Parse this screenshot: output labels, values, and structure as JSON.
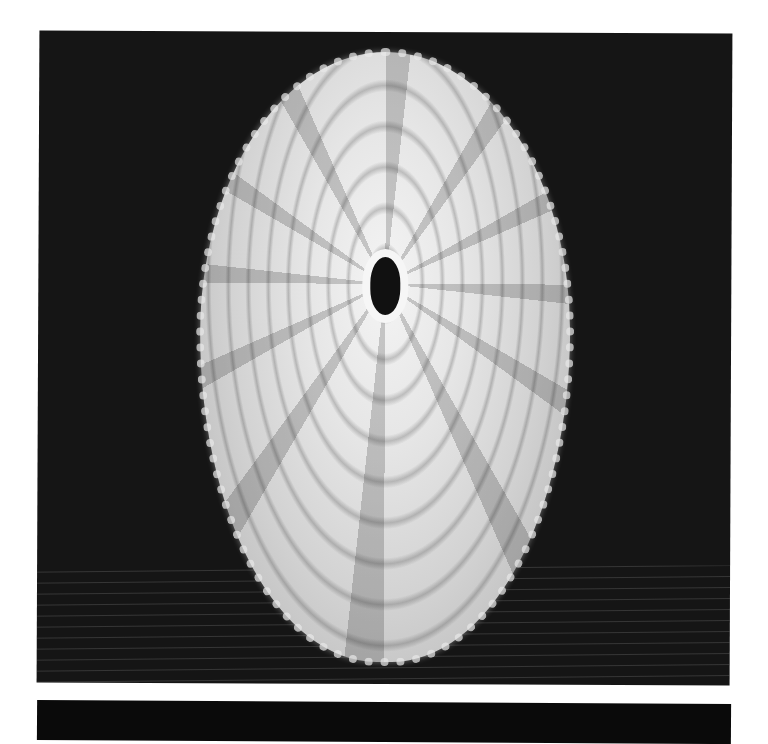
{
  "image": {
    "subject": "keyhole limpet shell",
    "view": "dorsal, apex up",
    "background_color": "#151515",
    "page_color": "#ffffff",
    "shell_color": "#e6e6e6",
    "pattern_color": "#4a4a4a",
    "orifice_color": "#111111"
  }
}
